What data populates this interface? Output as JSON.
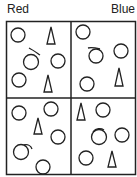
{
  "labels": {
    "left": "Red",
    "right": "Blue"
  },
  "colors": {
    "stroke": "#222222",
    "background": "#ffffff"
  },
  "grid": {
    "rows": 2,
    "cols": 2
  },
  "cells": [
    {
      "position": "top-left",
      "circles": 4,
      "triangles": 2,
      "marked_circles": 1
    },
    {
      "position": "top-right",
      "circles": 4,
      "triangles": 1,
      "marked_circles": 1
    },
    {
      "position": "bottom-left",
      "circles": 5,
      "triangles": 1,
      "marked_circles": 1
    },
    {
      "position": "bottom-right",
      "circles": 4,
      "triangles": 2,
      "marked_circles": 1
    }
  ]
}
